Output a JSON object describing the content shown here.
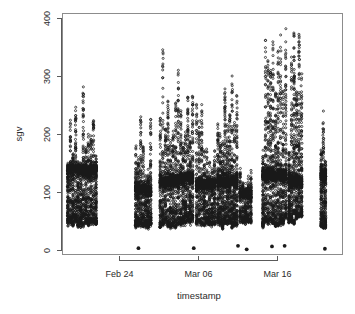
{
  "figure": {
    "kind": "r-base-scatterplot",
    "background": "#ffffff",
    "marker_color": "#1a1a1a",
    "axis_color": "#5a5a5a",
    "box_color": "#8c8c8c"
  },
  "labels": {
    "xlabel": "timestamp",
    "ylabel": "sgv",
    "ytick_400": "400",
    "ytick_300": "300",
    "ytick_200": "200",
    "ytick_100": "100",
    "ytick_0": "0",
    "xtick_1": "Feb 24",
    "xtick_2": "Mar 06",
    "xtick_3": "Mar 16"
  },
  "chart_data": {
    "type": "scatter",
    "title": "",
    "xlabel": "timestamp",
    "ylabel": "sgv",
    "grid": false,
    "legend": null,
    "marker": "open-circle",
    "xtick_labels": [
      "Feb 24",
      "Mar 06",
      "Mar 16"
    ],
    "xtick_day_values": [
      24,
      34,
      44
    ],
    "ytick_labels": [
      "0",
      "100",
      "200",
      "300",
      "400"
    ],
    "ytick_values": [
      0,
      100,
      200,
      300,
      400
    ],
    "ylim": [
      -18,
      412
    ],
    "xlim": [
      16.6,
      51.0
    ],
    "x_axis_note": "x is day-of-series: day 24 = Feb 24, day 34 = Mar 06, day 44 = Mar 16",
    "clusters": [
      {
        "name": "cluster-feb18-feb21",
        "x_start": 17.3,
        "x_end": 21.2,
        "y_min": 42,
        "y_max": 300,
        "y_mode": 140,
        "density": "very-high",
        "n": 1150
      },
      {
        "name": "cluster-feb26-feb28",
        "x_start": 25.9,
        "x_end": 28.1,
        "y_min": 38,
        "y_max": 240,
        "y_mode": 105,
        "density": "high",
        "n": 600
      },
      {
        "name": "cluster-mar01-mar03",
        "x_start": 29.0,
        "x_end": 31.6,
        "y_min": 40,
        "y_max": 400,
        "y_mode": 120,
        "density": "high",
        "n": 720
      },
      {
        "name": "cluster-mar03-mar05",
        "x_start": 31.6,
        "x_end": 33.4,
        "y_min": 45,
        "y_max": 295,
        "y_mode": 125,
        "density": "high",
        "n": 540
      },
      {
        "name": "cluster-mar05-mar08",
        "x_start": 33.6,
        "x_end": 36.2,
        "y_min": 42,
        "y_max": 255,
        "y_mode": 115,
        "density": "high",
        "n": 640
      },
      {
        "name": "cluster-mar08-mar11",
        "x_start": 36.3,
        "x_end": 39.0,
        "y_min": 40,
        "y_max": 400,
        "y_mode": 120,
        "density": "very-high",
        "n": 880
      },
      {
        "name": "cluster-mar11-mar13",
        "x_start": 39.1,
        "x_end": 40.8,
        "y_min": 48,
        "y_max": 175,
        "y_mode": 100,
        "density": "medium",
        "n": 330
      },
      {
        "name": "cluster-mar14-mar17",
        "x_start": 42.0,
        "x_end": 45.2,
        "y_min": 42,
        "y_max": 400,
        "y_mode": 130,
        "density": "very-high",
        "n": 1020
      },
      {
        "name": "cluster-mar17-mar19",
        "x_start": 45.3,
        "x_end": 47.2,
        "y_min": 45,
        "y_max": 400,
        "y_mode": 120,
        "density": "high",
        "n": 700
      },
      {
        "name": "cluster-mar22-mar23",
        "x_start": 49.4,
        "x_end": 50.2,
        "y_min": 38,
        "y_max": 280,
        "y_mode": 130,
        "density": "medium",
        "n": 300
      }
    ],
    "zero_points": [
      {
        "x": 26.4,
        "y": 4
      },
      {
        "x": 33.4,
        "y": 4
      },
      {
        "x": 39.0,
        "y": 8
      },
      {
        "x": 40.1,
        "y": 2
      },
      {
        "x": 43.3,
        "y": 7
      },
      {
        "x": 44.9,
        "y": 8
      },
      {
        "x": 50.0,
        "y": 3
      }
    ]
  }
}
